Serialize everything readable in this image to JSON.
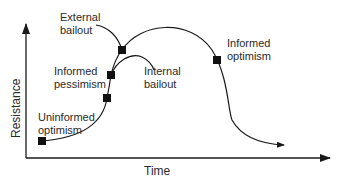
{
  "diagram": {
    "type": "resistance-over-time curve",
    "x_axis_label": "Time",
    "y_axis_label": "Resistance",
    "stages": [
      {
        "label": "Uninformed\noptimism",
        "marker": [
          42,
          141
        ]
      },
      {
        "label": "Informed\npessimism",
        "marker": [
          111,
          75
        ]
      },
      {
        "label": "External\nbailout",
        "marker": [
          122,
          50
        ]
      },
      {
        "label": "Internal\nbailout",
        "marker": null
      },
      {
        "label": "Informed\noptimism",
        "marker": [
          217,
          60
        ]
      }
    ],
    "extra_marker": [
      107,
      98
    ],
    "colors": {
      "line": "#1a1a1a",
      "text": "#2a2a2a",
      "background": "#ffffff"
    }
  }
}
